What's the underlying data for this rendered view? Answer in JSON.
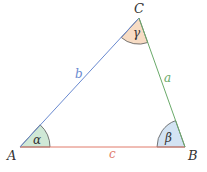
{
  "vertices": {
    "A": {
      "label": "A",
      "x": 20,
      "y": 147
    },
    "B": {
      "label": "B",
      "x": 185,
      "y": 147
    },
    "C": {
      "label": "C",
      "x": 139,
      "y": 18
    }
  },
  "sides": {
    "a": {
      "label": "a",
      "color": "#6aaa6a"
    },
    "b": {
      "label": "b",
      "color": "#6a8ad0"
    },
    "c": {
      "label": "c",
      "color": "#e07a6a"
    }
  },
  "angles": {
    "alpha": {
      "label": "α",
      "fill": "#cfe8d6"
    },
    "beta": {
      "label": "β",
      "fill": "#d3e3f3"
    },
    "gamma": {
      "label": "γ",
      "fill": "#f7dcc4"
    }
  }
}
